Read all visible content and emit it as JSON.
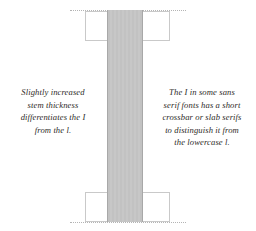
{
  "figure": {
    "background_color": "#ffffff",
    "width": 256,
    "height": 231,
    "stem": {
      "label": "letter-i-stem",
      "fill_color": "#c4c4c4",
      "edge_color": "#a8a8a8"
    },
    "serif_boxes": {
      "label": "slab-serif-outline",
      "outline_color": "#c9c9c9",
      "fill_color": "#ffffff",
      "count": 2
    },
    "guides": {
      "label": "dotted-guide-line",
      "color": "#b4b4b4",
      "style": "dotted",
      "count": 2
    }
  },
  "captions": {
    "left": {
      "name": "stem-thickness-note",
      "lines": [
        "Slightly increased",
        "stem thickness",
        "differentiates the I",
        "from the l."
      ],
      "full_text": "Slightly increased stem thickness differentiates the I from the l.",
      "align": "center",
      "color": "#2e2b28"
    },
    "right": {
      "name": "crossbar-serif-note",
      "lines": [
        "The I in some sans",
        "serif fonts has a short",
        "crossbar or slab serifs",
        "to distinguish it from",
        "the lowercase l."
      ],
      "full_text": "The I in some sans serif fonts has a short crossbar or slab serifs to distinguish it from the lowercase l.",
      "align": "center",
      "color": "#2e2b28"
    }
  }
}
